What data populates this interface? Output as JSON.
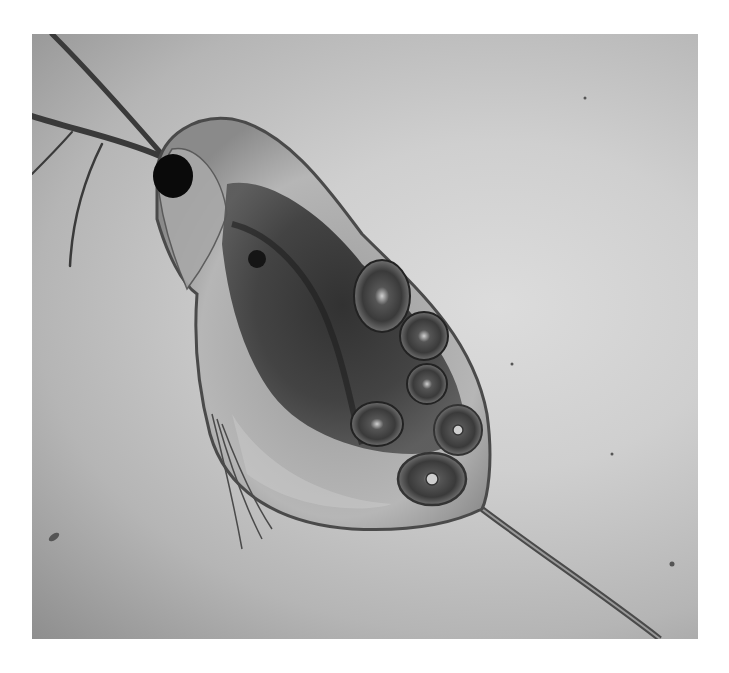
{
  "image": {
    "subject": "Daphnia (water flea) under light microscope",
    "description": "Grayscale micrograph of a Daphnia with eggs in its brood chamber, compound eye at upper left, antennae extending to the upper left corner, and a long tail spine extending to the bottom right.",
    "colors": {
      "background_light": "#dcdcdc",
      "background_dark": "#8e8e8e",
      "body_shell": "#b8b8b8",
      "body_inner": "#3a3a3a",
      "eye": "#0a0a0a",
      "page": "#ffffff"
    },
    "frame": {
      "x": 32,
      "y": 34,
      "width": 666,
      "height": 605
    }
  }
}
